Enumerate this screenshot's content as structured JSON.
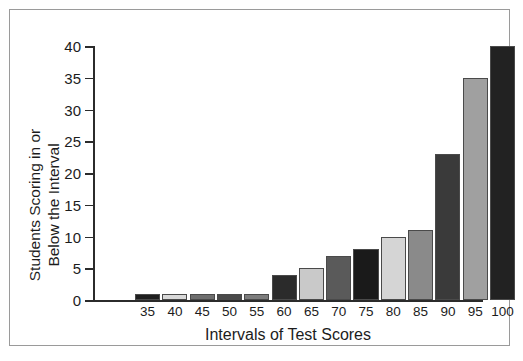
{
  "chart_data": {
    "type": "bar",
    "title": "",
    "xlabel": "Intervals of Test Scores",
    "ylabel_line1": "Students Scoring in or",
    "ylabel_line2": "Below the Interval",
    "categories": [
      "35",
      "40",
      "45",
      "50",
      "55",
      "60",
      "65",
      "70",
      "75",
      "80",
      "85",
      "90",
      "95",
      "100"
    ],
    "values": [
      1,
      1,
      1,
      1,
      1,
      4,
      5,
      7,
      8,
      10,
      11,
      23,
      35,
      40
    ],
    "bar_colors": [
      "#1f1f1f",
      "#d9d9d9",
      "#6e6e6e",
      "#4a4a4a",
      "#7d7d7d",
      "#2b2b2b",
      "#c9c9c9",
      "#5a5a5a",
      "#1a1a1a",
      "#d5d5d5",
      "#8a8a8a",
      "#3a3a3a",
      "#a0a0a0",
      "#222222"
    ],
    "ylim": [
      0,
      40
    ],
    "yticks": [
      0,
      5,
      10,
      15,
      20,
      25,
      30,
      35,
      40
    ],
    "grid": false,
    "legend": "none",
    "axis_color": "#2b2b2b",
    "border_color": "#9a9a9a",
    "background": "#ffffff"
  }
}
